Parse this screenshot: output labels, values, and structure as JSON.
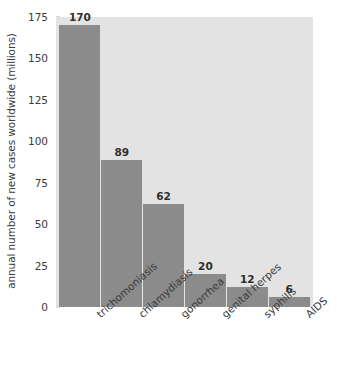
{
  "chart_data": {
    "type": "bar",
    "title": "",
    "subtitle": "",
    "xlabel": "",
    "ylabel": "annual number of new cases worldwide (millions)",
    "categories": [
      "trichomoniasis",
      "chlamydiasis",
      "gonorrhea",
      "genital herpes",
      "syphilis",
      "AIDS"
    ],
    "values": [
      170,
      89,
      62,
      20,
      12,
      6
    ],
    "value_labels": [
      "170",
      "89",
      "62",
      "20",
      "12",
      "6"
    ],
    "ylim": [
      0,
      175
    ],
    "yticks": [
      0,
      25,
      50,
      75,
      100,
      125,
      150,
      175
    ],
    "ytick_labels": [
      "0",
      "25",
      "50",
      "75",
      "100",
      "125",
      "150",
      "175"
    ],
    "grid": false,
    "legend": null,
    "legend_position": "none",
    "bar_color": "#8b8b8b",
    "plot_background": "#e3e3e3",
    "figure_background": "#ffffff",
    "text_color": "#3b3b3b"
  }
}
